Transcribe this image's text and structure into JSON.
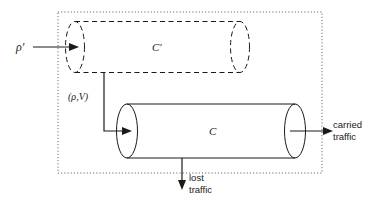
{
  "diagram": {
    "canvas": {
      "width": 374,
      "height": 206,
      "background": "#ffffff"
    },
    "colors": {
      "stroke": "#1a1a1a",
      "dotted_boundary": "#555555",
      "background": "#ffffff"
    },
    "boundary": {
      "name": "system-boundary",
      "style": "dotted",
      "x": 58,
      "y": 12,
      "width": 264,
      "height": 161
    },
    "shapes": [
      {
        "id": "virtual-cylinder",
        "label": "C'",
        "style": "dashed",
        "left_cap_cx": 75,
        "right_cap_cx": 240,
        "cy": 47,
        "rx": 9.5,
        "ry": 25.5,
        "label_x": 152,
        "label_y": 51
      },
      {
        "id": "real-cylinder",
        "label": "C",
        "style": "solid",
        "left_cap_cx": 127,
        "right_cap_cx": 295,
        "cy": 131,
        "rx": 10.5,
        "ry": 27,
        "label_x": 209,
        "label_y": 135
      }
    ],
    "labels": {
      "rho_prime": "ρ′",
      "c_prime": "C′",
      "c": "C",
      "rho_v": "(ρ,V)",
      "carried_traffic_line1": "carried",
      "carried_traffic_line2": "traffic",
      "lost_traffic_line1": "lost",
      "lost_traffic_line2": "traffic"
    },
    "arrows": [
      {
        "name": "rho-prime-input-arrow",
        "description": "horizontal arrow from rho-prime label into left cap of virtual cylinder C'",
        "from_x": 33,
        "from_y": 47,
        "to_x": 76,
        "to_y": 47,
        "direction": "right"
      },
      {
        "name": "rho-v-input-arrow",
        "description": "connector from C' bottom down then right into left cap of cylinder C",
        "path": "M 104 73 L 104 131 L 128 131",
        "direction": "right"
      },
      {
        "name": "carried-traffic-arrow",
        "description": "arrow exiting right cap of cylinder C toward carried traffic label",
        "from_x": 290,
        "from_y": 131,
        "to_x": 330,
        "to_y": 131,
        "direction": "right"
      },
      {
        "name": "lost-traffic-arrow",
        "description": "arrow descending from bottom of cylinder C toward lost traffic label",
        "from_x": 182,
        "from_y": 158,
        "to_x": 182,
        "to_y": 186,
        "direction": "down"
      }
    ],
    "label_positions": {
      "rho_prime": {
        "x": 16,
        "y": 51
      },
      "rho_v": {
        "x": 68,
        "y": 100
      },
      "carried_traffic": {
        "x": 333,
        "y": 128
      },
      "lost_traffic": {
        "x": 188,
        "y": 184
      }
    }
  }
}
